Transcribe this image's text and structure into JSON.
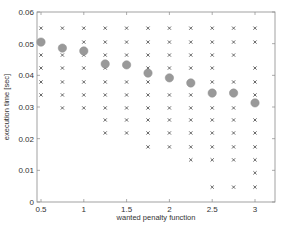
{
  "chart_data": {
    "type": "scatter",
    "title": "",
    "xlabel": "wanted penalty function",
    "ylabel": "execution time [sec]",
    "xlim": [
      0.45,
      3.25
    ],
    "ylim": [
      0,
      0.06
    ],
    "xticks": [
      0.5,
      1,
      1.5,
      2,
      2.5,
      3
    ],
    "xtick_labels": [
      "0.5",
      "1",
      "1.5",
      "2",
      "2.5",
      "3"
    ],
    "yticks": [
      0,
      0.01,
      0.02,
      0.03,
      0.04,
      0.05,
      0.06
    ],
    "ytick_labels": [
      "0",
      "0.01",
      "0.02",
      "0.03",
      "0.04",
      "0.05",
      "0.06"
    ],
    "grid": false,
    "legend": null,
    "series": [
      {
        "name": "samples",
        "marker": "x",
        "color": "#555555",
        "points": [
          [
            0.5,
            0.0549
          ],
          [
            0.5,
            0.0464
          ],
          [
            0.5,
            0.0423
          ],
          [
            0.5,
            0.0379
          ],
          [
            0.5,
            0.0338
          ],
          [
            0.75,
            0.0549
          ],
          [
            0.75,
            0.0464
          ],
          [
            0.75,
            0.0423
          ],
          [
            0.75,
            0.0379
          ],
          [
            0.75,
            0.0338
          ],
          [
            0.75,
            0.0297
          ],
          [
            1.0,
            0.0549
          ],
          [
            1.0,
            0.0505
          ],
          [
            1.0,
            0.0464
          ],
          [
            1.0,
            0.0423
          ],
          [
            1.0,
            0.0379
          ],
          [
            1.0,
            0.0338
          ],
          [
            1.0,
            0.0297
          ],
          [
            1.25,
            0.0549
          ],
          [
            1.25,
            0.0505
          ],
          [
            1.25,
            0.0464
          ],
          [
            1.25,
            0.0423
          ],
          [
            1.25,
            0.0379
          ],
          [
            1.25,
            0.0338
          ],
          [
            1.25,
            0.0297
          ],
          [
            1.25,
            0.0259
          ],
          [
            1.25,
            0.0218
          ],
          [
            1.5,
            0.0549
          ],
          [
            1.5,
            0.0505
          ],
          [
            1.5,
            0.0464
          ],
          [
            1.5,
            0.0379
          ],
          [
            1.5,
            0.0338
          ],
          [
            1.5,
            0.0297
          ],
          [
            1.5,
            0.0259
          ],
          [
            1.5,
            0.0218
          ],
          [
            1.75,
            0.0549
          ],
          [
            1.75,
            0.0505
          ],
          [
            1.75,
            0.0464
          ],
          [
            1.75,
            0.0423
          ],
          [
            1.75,
            0.0379
          ],
          [
            1.75,
            0.0338
          ],
          [
            1.75,
            0.0297
          ],
          [
            1.75,
            0.0259
          ],
          [
            1.75,
            0.0218
          ],
          [
            1.75,
            0.0174
          ],
          [
            2.0,
            0.0549
          ],
          [
            2.0,
            0.0505
          ],
          [
            2.0,
            0.0464
          ],
          [
            2.0,
            0.0423
          ],
          [
            2.0,
            0.0338
          ],
          [
            2.0,
            0.0297
          ],
          [
            2.0,
            0.0259
          ],
          [
            2.0,
            0.0218
          ],
          [
            2.0,
            0.0174
          ],
          [
            2.25,
            0.0549
          ],
          [
            2.25,
            0.0505
          ],
          [
            2.25,
            0.0464
          ],
          [
            2.25,
            0.0423
          ],
          [
            2.25,
            0.0338
          ],
          [
            2.25,
            0.0297
          ],
          [
            2.25,
            0.0259
          ],
          [
            2.25,
            0.0218
          ],
          [
            2.25,
            0.0174
          ],
          [
            2.25,
            0.0133
          ],
          [
            2.5,
            0.0549
          ],
          [
            2.5,
            0.0505
          ],
          [
            2.5,
            0.0464
          ],
          [
            2.5,
            0.0423
          ],
          [
            2.5,
            0.0379
          ],
          [
            2.5,
            0.0297
          ],
          [
            2.5,
            0.0259
          ],
          [
            2.5,
            0.0218
          ],
          [
            2.5,
            0.0174
          ],
          [
            2.5,
            0.0133
          ],
          [
            2.5,
            0.0047
          ],
          [
            2.75,
            0.0549
          ],
          [
            2.75,
            0.0505
          ],
          [
            2.75,
            0.0464
          ],
          [
            2.75,
            0.0379
          ],
          [
            2.75,
            0.0297
          ],
          [
            2.75,
            0.0259
          ],
          [
            2.75,
            0.0218
          ],
          [
            2.75,
            0.0174
          ],
          [
            2.75,
            0.0133
          ],
          [
            2.75,
            0.0047
          ],
          [
            3.0,
            0.0549
          ],
          [
            3.0,
            0.0505
          ],
          [
            3.0,
            0.0423
          ],
          [
            3.0,
            0.0379
          ],
          [
            3.0,
            0.0338
          ],
          [
            3.0,
            0.0259
          ],
          [
            3.0,
            0.0218
          ],
          [
            3.0,
            0.0174
          ],
          [
            3.0,
            0.0133
          ],
          [
            3.0,
            0.0092
          ],
          [
            3.0,
            0.0047
          ]
        ]
      },
      {
        "name": "mean",
        "marker": "o",
        "color": "#999999",
        "points": [
          [
            0.5,
            0.0505
          ],
          [
            0.75,
            0.0486
          ],
          [
            1.0,
            0.0477
          ],
          [
            1.25,
            0.0436
          ],
          [
            1.5,
            0.0433
          ],
          [
            1.75,
            0.0407
          ],
          [
            2.0,
            0.0392
          ],
          [
            2.25,
            0.0376
          ],
          [
            2.5,
            0.0344
          ],
          [
            2.75,
            0.0344
          ],
          [
            3.0,
            0.0313
          ]
        ]
      }
    ]
  }
}
